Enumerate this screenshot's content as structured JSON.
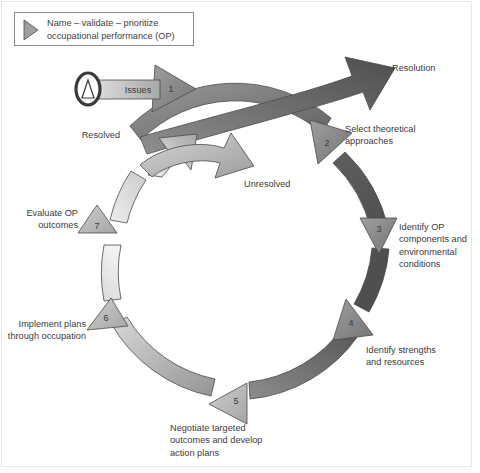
{
  "figure": {
    "background_color": "#ffffff",
    "frame_color": "#e6e6e6"
  },
  "legend": {
    "icon": "triangle-right-icon",
    "text": "Name – validate – prioritize\noccupational performance (OP)"
  },
  "start_node": {
    "icon": "oval-triangle-start-icon",
    "label": "Issues"
  },
  "entry_arrow": {
    "name": "issues-entry-arrow",
    "number": "1"
  },
  "exit_arrows": [
    {
      "name": "resolution-arrow",
      "label": "Resolution",
      "color": "#5c5c5c"
    },
    {
      "name": "resolved-arrow",
      "label": "Resolved",
      "color": "#b0b0b0"
    },
    {
      "name": "unresolved-arrow",
      "label": "Unresolved",
      "color": "#a3a3a3"
    }
  ],
  "cycle_steps": [
    {
      "number": "1",
      "label": "",
      "color": "#8a8a8a"
    },
    {
      "number": "2",
      "label": "Select theoretical\napproaches",
      "color": "#6e6e6e"
    },
    {
      "number": "3",
      "label": "Identify OP\ncomponents and\nenvironmental\nconditions",
      "color": "#585858"
    },
    {
      "number": "4",
      "label": "Identify strengths\nand resources",
      "color": "#5f5f5f"
    },
    {
      "number": "5",
      "label": "Negotiate targeted\noutcomes and develop\naction plans",
      "color": "#8f8f8f"
    },
    {
      "number": "6",
      "label": "Implement plans\nthrough occupation",
      "color": "#b5b5b5"
    },
    {
      "number": "7",
      "label": "Evaluate OP\noutcomes",
      "color": "#b8b8b8"
    }
  ],
  "colors": {
    "ring_dark": "#555555",
    "ring_mid": "#8e8e8e",
    "ring_light": "#e3e3e3",
    "stroke": "#4a4a4a",
    "text": "#3a3a3a"
  }
}
